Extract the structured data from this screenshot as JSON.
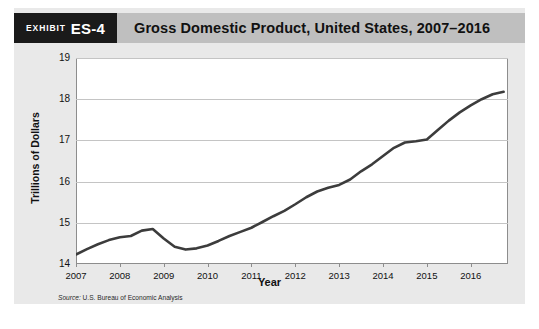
{
  "exhibit": {
    "label": "Exhibit",
    "number": "ES-4",
    "title": "Gross Domestic Product, United States, 2007–2016"
  },
  "source": {
    "prefix": "Source:",
    "text": "U.S. Bureau of Economic Analysis"
  },
  "colors": {
    "card_background": "#e9e9e9",
    "header_bar": "#bfbfbf",
    "badge": "#1a1a1a",
    "plot_background": "#ffffff",
    "gridline": "#c4c4c4",
    "line": "#3c3c3c"
  },
  "chart_data": {
    "type": "line",
    "title": "Gross Domestic Product, United States, 2007–2016",
    "xlabel": "Year",
    "ylabel": "Trillions of Dollars",
    "xlim": [
      2007,
      2016
    ],
    "ylim": [
      14,
      19
    ],
    "ytick_labels": [
      "19",
      "18",
      "17",
      "16",
      "15",
      "14"
    ],
    "ytick_values": [
      19,
      18,
      17,
      16,
      15,
      14
    ],
    "xtick_labels": [
      "2007",
      "2008",
      "2009",
      "2010",
      "2011",
      "2012",
      "2013",
      "2014",
      "2015",
      "2016"
    ],
    "xtick_values": [
      2007,
      2008,
      2009,
      2010,
      2011,
      2012,
      2013,
      2014,
      2015,
      2016
    ],
    "grid": true,
    "legend": "none",
    "series": [
      {
        "name": "Gross Domestic Product",
        "units": "Trillions of Dollars",
        "x": [
          2007.0,
          2007.25,
          2007.5,
          2007.75,
          2008.0,
          2008.25,
          2008.5,
          2008.75,
          2009.0,
          2009.25,
          2009.5,
          2009.75,
          2010.0,
          2010.25,
          2010.5,
          2010.75,
          2011.0,
          2011.25,
          2011.5,
          2011.75,
          2012.0,
          2012.25,
          2012.5,
          2012.75,
          2013.0,
          2013.25,
          2013.5,
          2013.75,
          2014.0,
          2014.25,
          2014.5,
          2014.75,
          2015.0,
          2015.25,
          2015.5,
          2015.75,
          2016.0,
          2016.25,
          2016.5,
          2016.75
        ],
        "values": [
          14.23,
          14.36,
          14.48,
          14.58,
          14.65,
          14.68,
          14.81,
          14.85,
          14.62,
          14.42,
          14.35,
          14.38,
          14.45,
          14.56,
          14.68,
          14.78,
          14.88,
          15.02,
          15.16,
          15.29,
          15.45,
          15.62,
          15.76,
          15.85,
          15.92,
          16.05,
          16.25,
          16.42,
          16.62,
          16.82,
          16.95,
          16.98,
          17.02,
          17.25,
          17.48,
          17.68,
          17.85,
          18.0,
          18.12,
          18.18
        ]
      }
    ]
  }
}
